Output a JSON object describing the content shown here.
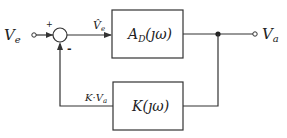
{
  "diagram": {
    "type": "feedback-block-diagram",
    "input": {
      "label": "V",
      "subscript": "e"
    },
    "output": {
      "label": "V",
      "subscript": "a"
    },
    "summing_junction": {
      "plus_sign": "+",
      "minus_sign": "-"
    },
    "error_signal": {
      "label": "V̂",
      "subscript": "e"
    },
    "forward_block": {
      "label": "A",
      "subscript": "D",
      "arg": "(ȷω)"
    },
    "feedback_block": {
      "label": "K",
      "arg": "(ȷω)"
    },
    "feedback_signal": {
      "label": "K·V",
      "subscript": "a"
    },
    "colors": {
      "line": "#333333",
      "background": "#ffffff"
    }
  }
}
